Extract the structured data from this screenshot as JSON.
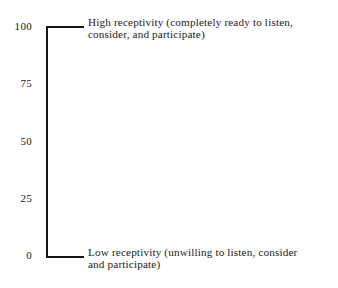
{
  "figure": {
    "name": "receptivity-scale",
    "type": "vertical-rating-scale",
    "background_color": "#ffffff",
    "ink_color": "#161616",
    "text_color": "#1b1b1b"
  },
  "scale": {
    "axis_orientation": "vertical",
    "axis_min": 0,
    "axis_max": 100,
    "tick_values": [
      100,
      75,
      50,
      25,
      0
    ],
    "tick_labels": [
      "100",
      "75",
      "50",
      "25",
      "0"
    ],
    "bracket_caps": [
      "top",
      "bottom"
    ]
  },
  "anchors": {
    "high": {
      "value": "100",
      "line1": "High receptivity (completely ready to listen,",
      "line2": "consider, and participate)"
    },
    "low": {
      "value": "0",
      "line1": "Low receptivity (unwilling to listen, consider",
      "line2": "and participate)"
    }
  },
  "chart_data": {
    "type": "table",
    "title": "",
    "xlabel": "",
    "ylabel": "",
    "ylim": [
      0,
      100
    ],
    "grid": false,
    "legend": "none",
    "categories": [
      "100",
      "75",
      "50",
      "25",
      "0"
    ],
    "values": [
      100,
      75,
      50,
      25,
      0
    ],
    "annotations": [
      {
        "at_value": 100,
        "text": "High receptivity (completely ready to listen, consider, and participate)"
      },
      {
        "at_value": 0,
        "text": "Low receptivity (unwilling to listen, consider and participate)"
      }
    ]
  }
}
